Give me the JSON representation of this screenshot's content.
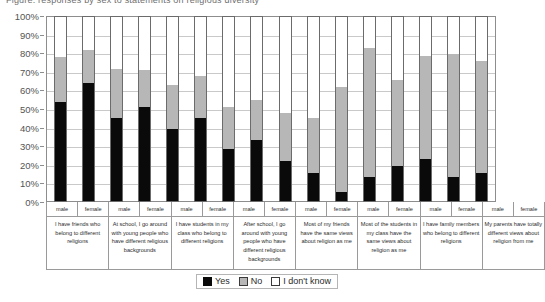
{
  "caption": {
    "text": "Figure: responses by sex to statements on religious diversity"
  },
  "legend": {
    "position": "bottom-center",
    "items": [
      {
        "label": "Yes",
        "color": "#0a0a0a",
        "icon": "legend-swatch-yes"
      },
      {
        "label": "No",
        "color": "#b7b7b7",
        "icon": "legend-swatch-no"
      },
      {
        "label": "I don't know",
        "color": "#ffffff",
        "icon": "legend-swatch-dont-know"
      }
    ]
  },
  "chart_data": {
    "type": "bar",
    "subtype": "stacked-100-percent",
    "title": "",
    "xlabel": "",
    "ylabel": "",
    "ylim": [
      0,
      100
    ],
    "grid": true,
    "ytick_labels": [
      "100%",
      "90%",
      "80%",
      "70%",
      "60%",
      "50%",
      "40%",
      "30%",
      "20%",
      "10%",
      "0%"
    ],
    "ytick_values": [
      100,
      90,
      80,
      70,
      60,
      50,
      40,
      30,
      20,
      10,
      0
    ],
    "sex_labels": [
      "male",
      "female"
    ],
    "series": [
      {
        "name": "Yes",
        "color": "#0a0a0a"
      },
      {
        "name": "No",
        "color": "#b7b7b7"
      },
      {
        "name": "I don't know",
        "color": "#ffffff"
      }
    ],
    "categories": [
      {
        "question": "I have friends who belong to different religions",
        "bars": [
          {
            "sex": "male",
            "Yes": 54,
            "No": 24,
            "I don't know": 22
          },
          {
            "sex": "female",
            "Yes": 64,
            "No": 18,
            "I don't know": 18
          }
        ]
      },
      {
        "question": "At school, I go around with young people who have different religious backgrounds",
        "bars": [
          {
            "sex": "male",
            "Yes": 45,
            "No": 27,
            "I don't know": 28
          },
          {
            "sex": "female",
            "Yes": 51,
            "No": 20,
            "I don't know": 29
          }
        ]
      },
      {
        "question": "I have students in my class who belong to different religions",
        "bars": [
          {
            "sex": "male",
            "Yes": 39,
            "No": 24,
            "I don't know": 37
          },
          {
            "sex": "female",
            "Yes": 45,
            "No": 23,
            "I don't know": 32
          }
        ]
      },
      {
        "question": "After school, I go around with young people who have different religious backgrounds",
        "bars": [
          {
            "sex": "male",
            "Yes": 28,
            "No": 23,
            "I don't know": 49
          },
          {
            "sex": "female",
            "Yes": 33,
            "No": 22,
            "I don't know": 45
          }
        ]
      },
      {
        "question": "Most of my friends have the same views about religion as me",
        "bars": [
          {
            "sex": "male",
            "Yes": 22,
            "No": 26,
            "I don't know": 52
          },
          {
            "sex": "female",
            "Yes": 15,
            "No": 30,
            "I don't know": 55
          }
        ]
      },
      {
        "question": "Most of the students in my class have the same views about religion as me",
        "bars": [
          {
            "sex": "male",
            "Yes": 5,
            "No": 57,
            "I don't know": 38
          },
          {
            "sex": "female",
            "Yes": 13,
            "No": 70,
            "I don't know": 17
          }
        ]
      },
      {
        "question": "I have family members who belong to different religions",
        "bars": [
          {
            "sex": "male",
            "Yes": 19,
            "No": 47,
            "I don't know": 34
          },
          {
            "sex": "female",
            "Yes": 23,
            "No": 56,
            "I don't know": 21
          }
        ]
      },
      {
        "question": "My parents have totally different views about religion from me",
        "bars": [
          {
            "sex": "male",
            "Yes": 13,
            "No": 67,
            "I don't know": 20
          },
          {
            "sex": "female",
            "Yes": 15,
            "No": 61,
            "I don't know": 24
          }
        ]
      }
    ]
  }
}
